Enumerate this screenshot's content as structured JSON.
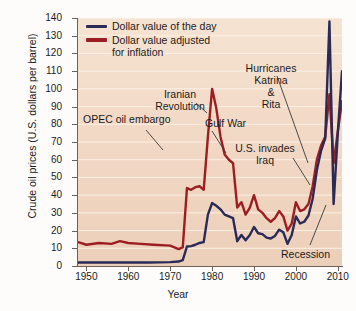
{
  "chart_data": {
    "type": "line",
    "title": "",
    "xlabel": "Year",
    "ylabel": "Crude oil prices (U.S. dollars per barrel)",
    "xlim": [
      1948,
      2011
    ],
    "ylim": [
      0,
      140
    ],
    "ytick_step": 10,
    "yticks": [
      0,
      10,
      20,
      30,
      40,
      50,
      60,
      70,
      80,
      90,
      100,
      110,
      120,
      130,
      140
    ],
    "xticks": [
      1950,
      1960,
      1970,
      1980,
      1990,
      2000,
      2010
    ],
    "grid": "horizontal",
    "legend_position": "top-left",
    "plot_background": "#f2d9c6",
    "series": [
      {
        "name": "Dollar value of the day",
        "color": "#2a2a56",
        "x": [
          1948,
          1950,
          1955,
          1960,
          1965,
          1970,
          1972,
          1973,
          1974,
          1975,
          1976,
          1977,
          1978,
          1979,
          1980,
          1981,
          1982,
          1983,
          1984,
          1985,
          1986,
          1987,
          1988,
          1989,
          1990,
          1991,
          1992,
          1993,
          1994,
          1995,
          1996,
          1997,
          1998,
          1999,
          2000,
          2001,
          2002,
          2003,
          2004,
          2005,
          2006,
          2007,
          2008,
          2009,
          2010,
          2011
        ],
        "values": [
          2.0,
          2.0,
          2.0,
          2.0,
          2.0,
          2.2,
          2.5,
          3.3,
          11.0,
          11.2,
          12.0,
          13.0,
          13.5,
          29.0,
          35.5,
          34.0,
          32.0,
          29.0,
          28.0,
          27.0,
          14.0,
          17.5,
          14.5,
          17.5,
          22.0,
          18.5,
          18.0,
          16.0,
          15.5,
          17.0,
          20.5,
          19.0,
          12.5,
          17.5,
          28.0,
          24.0,
          25.0,
          28.5,
          38.0,
          54.0,
          65.0,
          72.0,
          138.0,
          35.0,
          75.0,
          110.0
        ],
        "peak_label": "138 (2008)"
      },
      {
        "name": "Dollar value adjusted for inflation",
        "color": "#9c1e22",
        "x": [
          1948,
          1950,
          1953,
          1956,
          1958,
          1960,
          1963,
          1966,
          1970,
          1972,
          1973,
          1974,
          1975,
          1976,
          1977,
          1978,
          1979,
          1980,
          1981,
          1982,
          1983,
          1984,
          1985,
          1986,
          1987,
          1988,
          1989,
          1990,
          1991,
          1992,
          1993,
          1994,
          1995,
          1996,
          1997,
          1998,
          1999,
          2000,
          2001,
          2002,
          2003,
          2004,
          2005,
          2006,
          2007,
          2008,
          2009,
          2010,
          2011
        ],
        "values": [
          13.5,
          12.0,
          13.0,
          12.5,
          14.0,
          13.0,
          12.5,
          12.0,
          11.5,
          9.5,
          10.5,
          44.0,
          43.0,
          44.5,
          45.0,
          43.0,
          73.0,
          100.0,
          89.0,
          73.0,
          63.0,
          60.0,
          58.0,
          33.0,
          36.0,
          29.0,
          33.0,
          40.0,
          32.0,
          30.0,
          27.0,
          25.0,
          27.0,
          31.0,
          28.0,
          20.0,
          24.0,
          36.0,
          31.0,
          32.0,
          35.0,
          45.0,
          60.0,
          68.0,
          73.0,
          97.0,
          58.0,
          76.0,
          93.0
        ],
        "peak_label": "100 (1980)"
      }
    ],
    "annotations": [
      {
        "name": "opec-oil-embargo",
        "text": "OPEC oil embargo",
        "year": 1974
      },
      {
        "name": "iranian-revolution",
        "text": "Iranian\nRevolution",
        "year": 1979
      },
      {
        "name": "gulf-war",
        "text": "Gulf War",
        "year": 1990
      },
      {
        "name": "hurricanes-katrina-rita",
        "text": "Hurricanes\nKatrina\n&\nRita",
        "year": 2005
      },
      {
        "name": "us-invades-iraq",
        "text": "U.S. invades\nIraq",
        "year": 2003
      },
      {
        "name": "recession",
        "text": "Recession",
        "year": 2009
      }
    ]
  },
  "axes": {
    "ylabel": "Crude oil prices (U.S. dollars per barrel)",
    "xlabel": "Year",
    "ytick_labels": [
      "140",
      "130",
      "120",
      "110",
      "100",
      "90",
      "80",
      "70",
      "60",
      "50",
      "40",
      "30",
      "20",
      "10",
      "0"
    ],
    "xtick_labels": [
      "1950",
      "1960",
      "1970",
      "1980",
      "1990",
      "2000",
      "2010"
    ]
  },
  "legend": {
    "items": [
      {
        "label": "Dollar value of the day",
        "color": "#2a2a56"
      },
      {
        "label": "Dollar value adjusted\nfor inflation",
        "color": "#9c1e22"
      }
    ]
  },
  "annotations": {
    "opec": "OPEC oil embargo",
    "iran": "Iranian\nRevolution",
    "gulf": "Gulf War",
    "hurricanes": "Hurricanes\nKatrina\n&\nRita",
    "iraq": "U.S. invades\nIraq",
    "recession": "Recession"
  }
}
